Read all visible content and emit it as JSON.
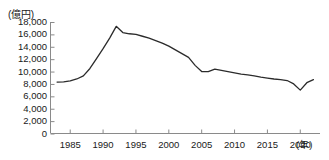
{
  "chart_data": {
    "type": "line",
    "title": "",
    "subtitle": "",
    "xlabel": "(年)",
    "ylabel": "(億円)",
    "ylim": [
      0,
      18000
    ],
    "xlim": [
      1982,
      2023
    ],
    "grid": false,
    "legend": null,
    "y_ticks": [
      18000,
      16000,
      14000,
      12000,
      10000,
      8000,
      6000,
      4000,
      2000,
      0
    ],
    "y_tick_labels": [
      "18,000",
      "16,000",
      "14,000",
      "12,000",
      "10,000",
      "8,000",
      "6,000",
      "4,000",
      "2,000",
      "0"
    ],
    "x_ticks": [
      1985,
      1990,
      1995,
      2000,
      2005,
      2010,
      2015,
      2020
    ],
    "x_tick_labels": [
      "1985",
      "1990",
      "1995",
      "2000",
      "2005",
      "2010",
      "2015",
      "2020"
    ],
    "line_color": "#2b2b2b",
    "axis_color": "#8a8a8a",
    "x": [
      1983,
      1984,
      1985,
      1986,
      1987,
      1988,
      1989,
      1990,
      1991,
      1992,
      1993,
      1994,
      1995,
      1996,
      1997,
      1998,
      1999,
      2000,
      2001,
      2002,
      2003,
      2004,
      2005,
      2006,
      2007,
      2008,
      2009,
      2010,
      2011,
      2012,
      2013,
      2014,
      2015,
      2016,
      2017,
      2018,
      2019,
      2020,
      2021,
      2022
    ],
    "values": [
      8300,
      8350,
      8500,
      8800,
      9300,
      10500,
      12100,
      13700,
      15400,
      17300,
      16300,
      16100,
      16000,
      15700,
      15400,
      15000,
      14600,
      14100,
      13500,
      12900,
      12300,
      11000,
      10000,
      10000,
      10400,
      10200,
      10000,
      9800,
      9600,
      9450,
      9300,
      9100,
      8950,
      8800,
      8700,
      8550,
      8000,
      7000,
      8200,
      8700
    ]
  }
}
